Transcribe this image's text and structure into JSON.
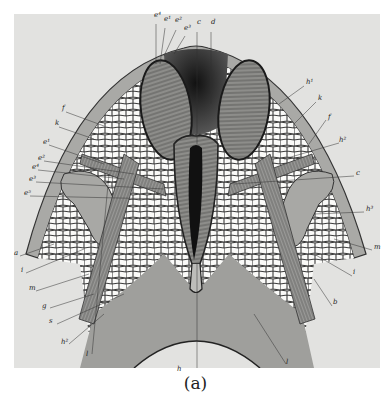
{
  "figure": {
    "caption": "(a)",
    "background": "#e2e2e0",
    "labels_top": [
      {
        "text": "e⁴",
        "x": 154,
        "y": 18
      },
      {
        "text": "e¹",
        "x": 164,
        "y": 22
      },
      {
        "text": "e²",
        "x": 175,
        "y": 23
      },
      {
        "text": "e³",
        "x": 184,
        "y": 31
      },
      {
        "text": "c",
        "x": 197,
        "y": 25
      },
      {
        "text": "d",
        "x": 211,
        "y": 25
      }
    ],
    "labels_left": [
      {
        "text": "f",
        "x": 62,
        "y": 111
      },
      {
        "text": "k",
        "x": 55,
        "y": 126
      },
      {
        "text": "e¹",
        "x": 43,
        "y": 145
      },
      {
        "text": "e²",
        "x": 38,
        "y": 161
      },
      {
        "text": "e⁴",
        "x": 32,
        "y": 170
      },
      {
        "text": "e³",
        "x": 29,
        "y": 182
      },
      {
        "text": "e⁵",
        "x": 24,
        "y": 196
      },
      {
        "text": "a",
        "x": 14,
        "y": 256
      },
      {
        "text": "i",
        "x": 21,
        "y": 273
      },
      {
        "text": "m",
        "x": 29,
        "y": 291
      },
      {
        "text": "g",
        "x": 42,
        "y": 309
      },
      {
        "text": "s",
        "x": 49,
        "y": 324
      },
      {
        "text": "h²",
        "x": 61,
        "y": 345
      },
      {
        "text": "l",
        "x": 86,
        "y": 357
      }
    ],
    "labels_right": [
      {
        "text": "h¹",
        "x": 306,
        "y": 85
      },
      {
        "text": "k",
        "x": 318,
        "y": 101
      },
      {
        "text": "f",
        "x": 328,
        "y": 120
      },
      {
        "text": "h²",
        "x": 339,
        "y": 143
      },
      {
        "text": "c",
        "x": 356,
        "y": 176
      },
      {
        "text": "h³",
        "x": 366,
        "y": 212
      },
      {
        "text": "m",
        "x": 374,
        "y": 250
      },
      {
        "text": "i",
        "x": 353,
        "y": 275
      },
      {
        "text": "b",
        "x": 333,
        "y": 305
      },
      {
        "text": "l",
        "x": 286,
        "y": 365
      }
    ],
    "labels_bottom": [
      {
        "text": "h",
        "x": 177,
        "y": 372
      }
    ]
  }
}
